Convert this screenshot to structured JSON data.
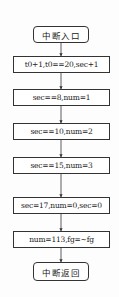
{
  "diagram": {
    "type": "flowchart",
    "nodes": [
      {
        "id": "start",
        "shape": "rounded",
        "label": "中断入口"
      },
      {
        "id": "n1",
        "shape": "rect",
        "label": "t0+1,t0==20,sec+1"
      },
      {
        "id": "n2",
        "shape": "rect",
        "label": "sec==8,num=1"
      },
      {
        "id": "n3",
        "shape": "rect",
        "label": "sec==10,num=2"
      },
      {
        "id": "n4",
        "shape": "rect",
        "label": "sec==15,num=3"
      },
      {
        "id": "n5",
        "shape": "rect",
        "label": "sec=17,num=0,sec=0"
      },
      {
        "id": "n6",
        "shape": "rect",
        "label": "num=113,fg=~fg"
      },
      {
        "id": "end",
        "shape": "rounded",
        "label": "中断返回"
      }
    ],
    "edges": [
      {
        "from": "start",
        "to": "n1"
      },
      {
        "from": "n1",
        "to": "n2"
      },
      {
        "from": "n2",
        "to": "n3"
      },
      {
        "from": "n3",
        "to": "n4"
      },
      {
        "from": "n4",
        "to": "n5"
      },
      {
        "from": "n5",
        "to": "n6"
      },
      {
        "from": "n6",
        "to": "end"
      }
    ]
  }
}
